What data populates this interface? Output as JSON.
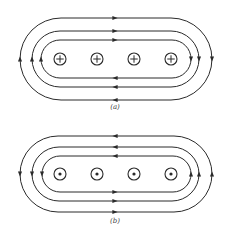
{
  "diagram": {
    "stroke_color": "#2a2a2a",
    "background": "#ffffff",
    "panels": [
      {
        "id": "a",
        "caption": "(a)",
        "caption_pos": {
          "x": 100,
          "y": 103
        },
        "center_y": 59,
        "current_direction": "into-page",
        "wire_symbol": "cross",
        "circulation": "clockwise",
        "wires_x": [
          60,
          97,
          134,
          171
        ],
        "wire_radius": 6,
        "loops": [
          {
            "name": "inner",
            "x1": 41,
            "x2": 191,
            "half_height": 19
          },
          {
            "name": "middle",
            "x1": 32,
            "x2": 199,
            "half_height": 28
          },
          {
            "name": "outer",
            "x1": 20,
            "x2": 212,
            "half_height": 41
          }
        ]
      },
      {
        "id": "b",
        "caption": "(b)",
        "caption_pos": {
          "x": 100,
          "y": 217
        },
        "center_y": 174,
        "current_direction": "out-of-page",
        "wire_symbol": "dot",
        "circulation": "counterclockwise",
        "wires_x": [
          60,
          97,
          134,
          171
        ],
        "wire_radius": 6,
        "loops": [
          {
            "name": "inner",
            "x1": 42,
            "x2": 191,
            "half_height": 18
          },
          {
            "name": "middle",
            "x1": 32,
            "x2": 199,
            "half_height": 27
          },
          {
            "name": "outer",
            "x1": 20,
            "x2": 212,
            "half_height": 38
          }
        ]
      }
    ]
  }
}
